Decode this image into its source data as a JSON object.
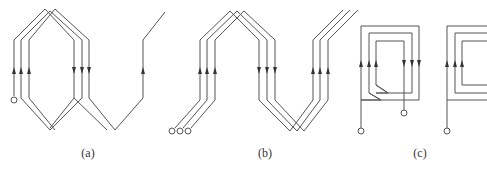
{
  "figure": {
    "panels": [
      {
        "id": "a",
        "label": "(a)",
        "label_x": 88,
        "description": "Lap-type concentric winding group with three coils and one connecting conductor"
      },
      {
        "id": "b",
        "label": "(b)",
        "label_x": 265,
        "description": "Wave winding with three parallel conductors"
      },
      {
        "id": "c",
        "label": "(c)",
        "label_x": 420,
        "description": "Concentric rectangular coil groups"
      }
    ],
    "colors": {
      "line": "#555555",
      "arrow": "#333333",
      "background": "#ffffff"
    }
  }
}
